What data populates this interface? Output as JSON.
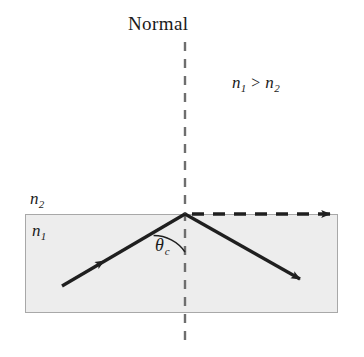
{
  "figure": {
    "width": 364,
    "height": 357,
    "background_color": "#ffffff"
  },
  "labels": {
    "normal": "Normal",
    "inequality": {
      "left_symbol": "n",
      "left_sub": "1",
      "operator": ">",
      "right_symbol": "n",
      "right_sub": "2"
    },
    "medium_upper": {
      "symbol": "n",
      "sub": "2"
    },
    "medium_lower": {
      "symbol": "n",
      "sub": "1"
    },
    "critical_angle": {
      "symbol": "θ",
      "sub": "c"
    }
  },
  "geometry": {
    "medium_rect": {
      "x": 25,
      "y": 214,
      "width": 313,
      "height": 99,
      "fill": "#ededed",
      "stroke": "#a8a8a8"
    },
    "normal_line": {
      "x": 185,
      "y_top": 42,
      "y_bottom": 346,
      "stroke": "#6e6e6e",
      "dash": "9 7",
      "width": 2
    },
    "incident_ray": {
      "from_x": 62,
      "from_y": 286,
      "to_x": 185,
      "to_y": 214,
      "arrow_at_x": 100,
      "arrow_at_y": 264,
      "stroke": "#1f1f1f",
      "width": 3
    },
    "reflected_ray": {
      "from_x": 185,
      "from_y": 214,
      "to_x": 303,
      "to_y": 281,
      "stroke": "#1f1f1f",
      "width": 3
    },
    "refracted_ray": {
      "from_x": 190,
      "from_y": 214,
      "to_x": 336,
      "to_y": 214,
      "stroke": "#1f1f1f",
      "width": 3,
      "dash": "12 8"
    },
    "angle_arc": {
      "center_x": 185,
      "center_y": 214,
      "radius": 38,
      "stroke": "#1f1f1f",
      "width": 1.4
    }
  },
  "colors": {
    "ray": "#1f1f1f",
    "normal": "#6e6e6e",
    "medium_fill": "#ededed",
    "medium_border": "#a8a8a8",
    "text": "#1a1a1a"
  }
}
